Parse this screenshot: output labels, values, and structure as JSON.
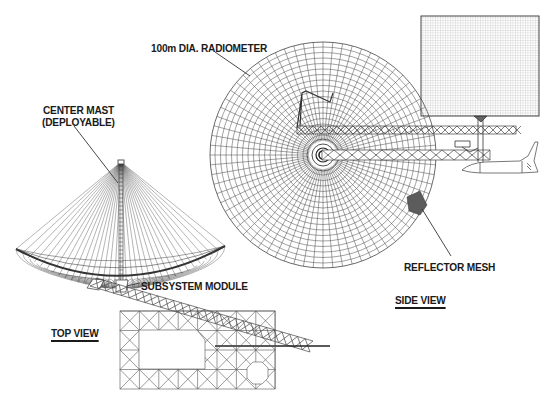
{
  "diagram": {
    "labels": {
      "radiometer": "100m DIA. RADIOMETER",
      "center_mast_line1": "CENTER MAST",
      "center_mast_line2": "(DEPLOYABLE)",
      "subsystem_module": "SUBSYSTEM MODULE",
      "reflector_mesh": "REFLECTOR MESH",
      "top_view": "TOP VIEW",
      "side_view": "SIDE VIEW"
    },
    "colors": {
      "line": "#3a3a3a",
      "mesh_light": "#8a8a8a",
      "highlight_mesh": "#5a5a5a",
      "background": "#ffffff"
    },
    "components": [
      {
        "name": "radiometer-dish-side-view",
        "shape": "circular mesh",
        "center": [
          323,
          155
        ],
        "radius": 113
      },
      {
        "name": "solar-panel-array",
        "shape": "rectangle",
        "bounds": [
          421,
          16,
          539,
          116
        ]
      },
      {
        "name": "space-shuttle",
        "shape": "orbiter outline"
      },
      {
        "name": "truss-boom-upper",
        "shape": "truss"
      },
      {
        "name": "truss-boom-lower",
        "shape": "truss"
      },
      {
        "name": "cone-reflector-top-view",
        "shape": "parabolic cone with radial ribs"
      },
      {
        "name": "rectangular-truss-frame",
        "shape": "truss frame"
      },
      {
        "name": "diagonal-truss-boom",
        "shape": "truss"
      }
    ]
  }
}
